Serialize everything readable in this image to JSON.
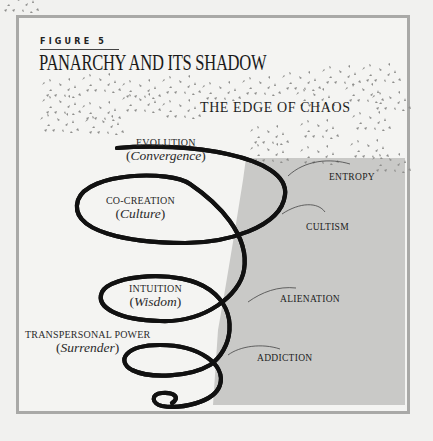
{
  "figure": {
    "label": "FIGURE 5",
    "title": "PANARCHY AND ITS SHADOW",
    "region_title": "THE EDGE OF CHAOS"
  },
  "spiral_levels": [
    {
      "name": "EVOLUTION",
      "quality": "Convergence",
      "shadow": "ENTROPY"
    },
    {
      "name": "CO-CREATION",
      "quality": "Culture",
      "shadow": "CULTISM"
    },
    {
      "name": "INTUITION",
      "quality": "Wisdom",
      "shadow": "ALIENATION"
    },
    {
      "name": "TRANSPERSONAL POWER",
      "quality": "Surrender",
      "shadow": "ADDICTION"
    }
  ],
  "colors": {
    "page": "#f1f1ef",
    "frame_border": "#a9a9a7",
    "shadow_region": "#c9c9c7",
    "ink": "#1a1a1a",
    "speckle": "#8a8a88"
  }
}
